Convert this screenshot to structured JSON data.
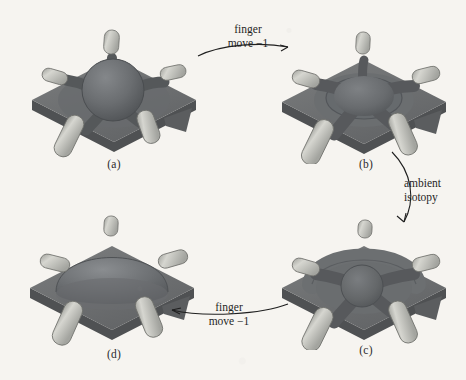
{
  "figure": {
    "background_color": "#f6f4f0",
    "ink_color": "#1f1f1f",
    "slab_color": "#6e7070",
    "slab_shadow_color": "#4f5153",
    "dome_color": "#63666a",
    "finger_color": "#c9c9c3",
    "finger_shade_color": "#8d8e89"
  },
  "panels": [
    {
      "id": "a",
      "caption": "(a)",
      "state": "round-sphere-with-five-fingers"
    },
    {
      "id": "b",
      "caption": "(b)",
      "state": "flattened-dome-with-four-fingers"
    },
    {
      "id": "c",
      "caption": "(c)",
      "state": "ridged-dome-with-four-fingers"
    },
    {
      "id": "d",
      "caption": "(d)",
      "state": "smooth-dome-with-five-fingers"
    }
  ],
  "arrows": [
    {
      "id": "a-to-b",
      "direction": "right",
      "label_top": "finger",
      "label_bottom": "move −1"
    },
    {
      "id": "b-to-c",
      "direction": "down",
      "label_top": "ambient",
      "label_bottom": "isotopy"
    },
    {
      "id": "c-to-d",
      "direction": "left",
      "label_top": "finger",
      "label_bottom": "move −1"
    }
  ]
}
